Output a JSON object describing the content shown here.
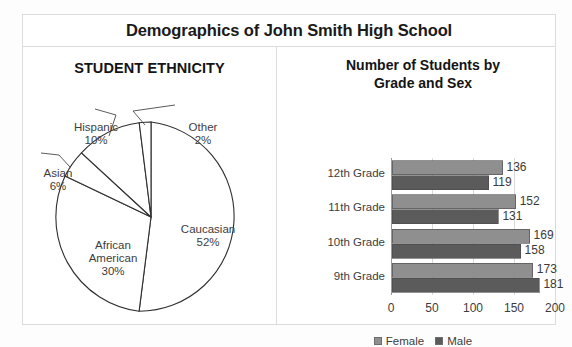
{
  "figure": {
    "title": "Demographics of John Smith High School",
    "background": "#ffffff",
    "frame_color": "#dcdcdc"
  },
  "pie_panel": {
    "title": "STUDENT ETHNICITY",
    "labels": {
      "hispanic_name": "Hispanic",
      "hispanic_pct": "10%",
      "other_name": "Other",
      "other_pct": "2%",
      "asian_name": "Asian",
      "asian_pct": "6%",
      "african_name_line1": "African",
      "african_name_line2": "American",
      "african_pct": "30%",
      "caucasian_name": "Caucasian",
      "caucasian_pct": "52%"
    }
  },
  "bar_panel": {
    "title_line1": "Number of Students by",
    "title_line2": "Grade and Sex",
    "legend": [
      {
        "label": "Female",
        "color": "#8f8f8f"
      },
      {
        "label": "Male",
        "color": "#5b5b5b"
      }
    ]
  },
  "chart_data": [
    {
      "type": "pie",
      "title": "STUDENT ETHNICITY",
      "categories": [
        "Caucasian",
        "African American",
        "Asian",
        "Hispanic",
        "Other"
      ],
      "values": [
        52,
        30,
        6,
        10,
        2
      ],
      "value_labels": [
        "52%",
        "30%",
        "6%",
        "10%",
        "2%"
      ],
      "unit": "percent",
      "slice_fill": "#ffffff",
      "slice_stroke": "#2f2f2f",
      "start_angle_deg": 0,
      "direction": "clockwise",
      "legend": false,
      "grid": false
    },
    {
      "type": "bar",
      "orientation": "horizontal",
      "title": "Number of Students by Grade and Sex",
      "categories": [
        "12th Grade",
        "11th Grade",
        "10th Grade",
        "9th Grade"
      ],
      "series": [
        {
          "name": "Female",
          "values": [
            136,
            152,
            169,
            173
          ],
          "color": "#8f8f8f"
        },
        {
          "name": "Male",
          "values": [
            119,
            131,
            158,
            181
          ],
          "color": "#5b5b5b"
        }
      ],
      "xlabel": "",
      "ylabel": "",
      "xlim": [
        0,
        200
      ],
      "xticks": [
        0,
        50,
        100,
        150,
        200
      ],
      "xtick_labels": [
        "0",
        "50",
        "100",
        "150",
        "200"
      ],
      "grid": true,
      "grid_axis": "x",
      "data_labels": true,
      "legend": true,
      "legend_position": "bottom"
    }
  ]
}
